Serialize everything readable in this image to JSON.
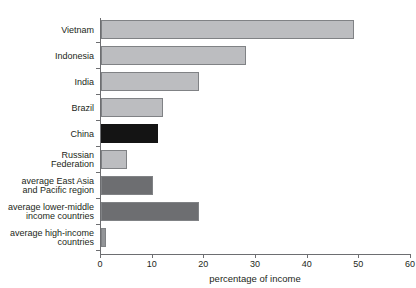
{
  "chart_data": {
    "type": "bar",
    "orientation": "horizontal",
    "title": "",
    "xlabel": "percentage of income",
    "ylabel": "",
    "xlim": [
      0,
      60
    ],
    "xticks": [
      0,
      10,
      20,
      30,
      40,
      50,
      60
    ],
    "grid": false,
    "legend": false,
    "categories": [
      "Vietnam",
      "Indonesia",
      "India",
      "Brazil",
      "China",
      "Russian\nFederation",
      "average East Asia\nand Pacific region",
      "average lower-middle\nincome countries",
      "average high-income\ncountries"
    ],
    "values": [
      49,
      28,
      19,
      12,
      11,
      5,
      10,
      19,
      1
    ],
    "bar_colors": [
      "#bcbdc0",
      "#bcbdc0",
      "#bcbdc0",
      "#bcbdc0",
      "#141414",
      "#bcbdc0",
      "#6d6e71",
      "#6d6e71",
      "#939598"
    ]
  },
  "colors": {
    "axis": "#6d6e71",
    "text": "#231f20",
    "background": "#ffffff",
    "bar_light": "#bcbdc0",
    "bar_medium": "#939598",
    "bar_dark": "#6d6e71",
    "bar_black": "#141414",
    "bar_outline": "#808285"
  }
}
